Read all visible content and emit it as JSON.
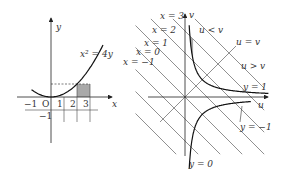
{
  "left": {
    "x_axis_label": "x",
    "y_axis_label": "y",
    "curve_label": "x² = 4y",
    "tick_labels": [
      "−1",
      "O",
      "1",
      "2",
      "3"
    ],
    "neg_y_label": "−1",
    "curve": "x^2 = 4y",
    "shaded_x_range": [
      2,
      3
    ],
    "colors": {
      "stroke": "#222222",
      "shade": "#a9a9a9"
    }
  },
  "right": {
    "u_axis_label": "u",
    "v_axis_label": "v",
    "line_labels": [
      "x = 3",
      "x = 2",
      "x = 1",
      "x = 0",
      "x = −1"
    ],
    "line_values": [
      3,
      2,
      1,
      0,
      -1,
      -2,
      -3,
      4
    ],
    "diag_label": "u = v",
    "region_above": "u < v",
    "region_below": "u > v",
    "curve_labels": {
      "pos": "y = 1",
      "neg": "y = −1",
      "zero": "y = 0"
    },
    "colors": {
      "stroke": "#222222",
      "shade": "#a9a9a9"
    }
  }
}
